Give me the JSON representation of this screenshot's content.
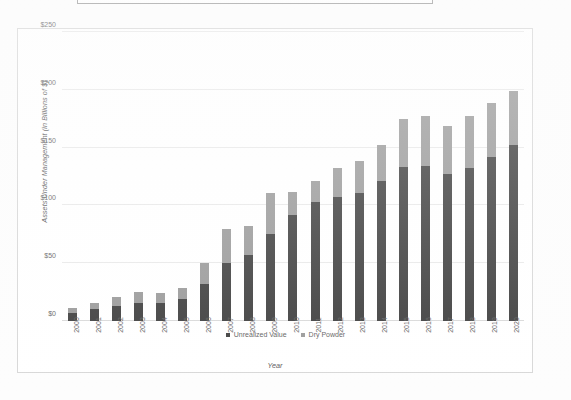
{
  "chart_data": {
    "type": "bar",
    "stacked": true,
    "title": "",
    "xlabel": "Year",
    "ylabel": "Assets Under Management (in Billions of $)",
    "ylim": [
      0,
      250
    ],
    "yticks": [
      "$0",
      "$50",
      "$100",
      "$150",
      "$200",
      "$250"
    ],
    "ytick_values": [
      0,
      50,
      100,
      150,
      200,
      250
    ],
    "grid": true,
    "legend_position": "bottom",
    "categories": [
      "2000",
      "2001",
      "2002",
      "2003",
      "2004",
      "2005",
      "2006",
      "2007",
      "2008",
      "2009",
      "2010",
      "2011",
      "2012",
      "2013",
      "2014",
      "2015",
      "2016",
      "2017",
      "2018",
      "2019",
      "2020"
    ],
    "series": [
      {
        "name": "Unrealized Value",
        "color": "#414141",
        "values": [
          7,
          10,
          13,
          16,
          16,
          19,
          32,
          50,
          57,
          75,
          92,
          103,
          107,
          111,
          121,
          133,
          134,
          127,
          132,
          142,
          152
        ]
      },
      {
        "name": "Dry Powder",
        "color": "#9b9b9b",
        "values": [
          4,
          6,
          8,
          9,
          8,
          10,
          18,
          30,
          25,
          36,
          20,
          18,
          25,
          27,
          31,
          42,
          43,
          42,
          45,
          47,
          47
        ]
      }
    ],
    "totals": [
      11,
      16,
      21,
      25,
      24,
      29,
      50,
      80,
      82,
      111,
      112,
      121,
      132,
      138,
      152,
      175,
      177,
      169,
      177,
      189,
      199
    ]
  },
  "legend": {
    "items": [
      {
        "label": "Unrealized Value",
        "color": "#414141"
      },
      {
        "label": "Dry Powder",
        "color": "#9b9b9b"
      }
    ]
  }
}
